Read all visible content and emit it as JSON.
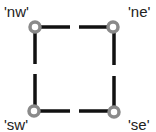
{
  "diagram": {
    "type": "corner-handles",
    "line_color": "#111111",
    "handle_stroke": "#8a8a8a",
    "handle_fill": "#ffffff",
    "corners": [
      {
        "id": "nw",
        "label": "'nw'"
      },
      {
        "id": "ne",
        "label": "'ne'"
      },
      {
        "id": "sw",
        "label": "'sw'"
      },
      {
        "id": "se",
        "label": "'se'"
      }
    ]
  }
}
